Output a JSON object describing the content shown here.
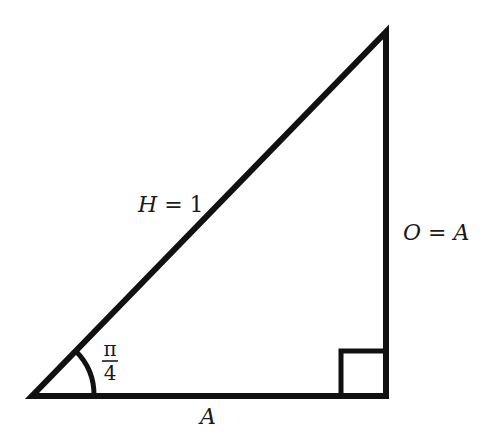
{
  "diagram": {
    "type": "right-triangle",
    "stroke_color": "#111111",
    "background": "#ffffff",
    "labels": {
      "hypotenuse_var": "H",
      "hypotenuse_eq": " = 1",
      "opposite_var": "O",
      "opposite_eq": " = ",
      "opposite_rhs": "A",
      "adjacent": "A",
      "angle_numerator": "π",
      "angle_denominator": "4"
    },
    "vertices": {
      "angle_vertex": [
        32,
        396
      ],
      "right_angle_vertex": [
        386,
        396
      ],
      "top_vertex": [
        386,
        32
      ]
    },
    "right_angle_marker_size": 45,
    "angle_arc_radius": 62
  }
}
